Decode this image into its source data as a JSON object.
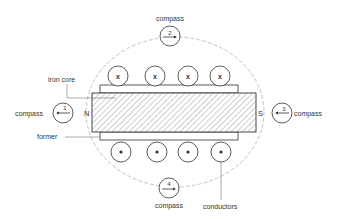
{
  "diagram": {
    "colors": {
      "stroke": "#333333",
      "field_line": "#999999",
      "background": "#ffffff"
    },
    "labels": {
      "iron_core": "iron core",
      "former": "former",
      "conductors": "conductors",
      "north_pole": "N",
      "south_pole": "S"
    },
    "compasses": [
      {
        "id": 1,
        "number": "1",
        "label": "compass",
        "position": "left",
        "needle_direction": "left"
      },
      {
        "id": 2,
        "number": "2",
        "label": "compass",
        "position": "top",
        "needle_direction": "right"
      },
      {
        "id": 3,
        "number": "3",
        "label": "compass",
        "position": "right",
        "needle_direction": "left"
      },
      {
        "id": 4,
        "number": "4",
        "label": "compass",
        "position": "bottom",
        "needle_direction": "right"
      }
    ],
    "conductors_top": [
      {
        "symbol": "x",
        "meaning": "current into page"
      },
      {
        "symbol": "x",
        "meaning": "current into page"
      },
      {
        "symbol": "x",
        "meaning": "current into page"
      },
      {
        "symbol": "x",
        "meaning": "current into page"
      }
    ],
    "conductors_bottom": [
      {
        "symbol": "dot",
        "meaning": "current out of page"
      },
      {
        "symbol": "dot",
        "meaning": "current out of page"
      },
      {
        "symbol": "dot",
        "meaning": "current out of page"
      },
      {
        "symbol": "dot",
        "meaning": "current out of page"
      }
    ]
  }
}
